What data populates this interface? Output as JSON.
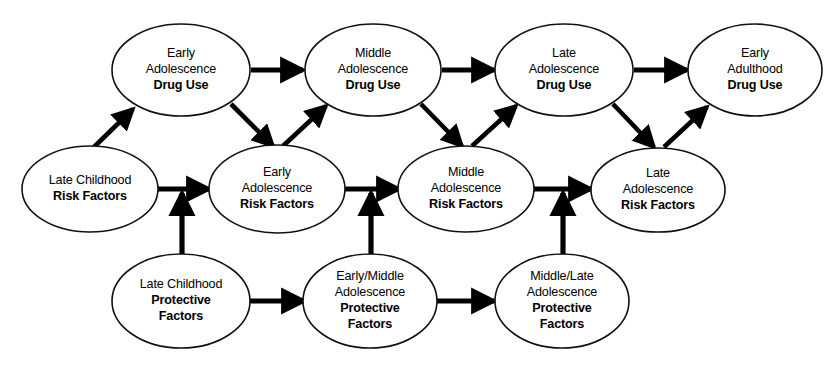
{
  "diagram": {
    "background_color": "#ffffff",
    "line_color": "#000000",
    "node_fill": "#ffffff",
    "node_stroke": "#111111",
    "rows": {
      "top_label": "Drug Use",
      "middle_label": "Risk Factors",
      "bottom_label": "Protective Factors"
    },
    "nodes": [
      {
        "id": "ea-drug-use",
        "name": "early-adolescence-drug-use",
        "cx": 181,
        "cy": 70,
        "rx": 69,
        "ry": 46,
        "lines": [
          {
            "text": "Early",
            "bold": false
          },
          {
            "text": "Adolescence",
            "bold": false
          },
          {
            "text": "Drug Use",
            "bold": true
          }
        ]
      },
      {
        "id": "ma-drug-use",
        "name": "middle-adolescence-drug-use",
        "cx": 373,
        "cy": 70,
        "rx": 68,
        "ry": 46,
        "lines": [
          {
            "text": "Middle",
            "bold": false
          },
          {
            "text": "Adolescence",
            "bold": false
          },
          {
            "text": "Drug Use",
            "bold": true
          }
        ]
      },
      {
        "id": "la-drug-use",
        "name": "late-adolescence-drug-use",
        "cx": 564,
        "cy": 70,
        "rx": 69,
        "ry": 46,
        "lines": [
          {
            "text": "Late",
            "bold": false
          },
          {
            "text": "Adolescence",
            "bold": false
          },
          {
            "text": "Drug Use",
            "bold": true
          }
        ]
      },
      {
        "id": "eadult-drug-use",
        "name": "early-adulthood-drug-use",
        "cx": 755,
        "cy": 70,
        "rx": 67,
        "ry": 46,
        "lines": [
          {
            "text": "Early",
            "bold": false
          },
          {
            "text": "Adulthood",
            "bold": false
          },
          {
            "text": "Drug Use",
            "bold": true
          }
        ]
      },
      {
        "id": "lc-risk",
        "name": "late-childhood-risk-factors",
        "cx": 90,
        "cy": 189,
        "rx": 68,
        "ry": 43,
        "lines": [
          {
            "text": "Late Childhood",
            "bold": false
          },
          {
            "text": "Risk Factors",
            "bold": true
          }
        ]
      },
      {
        "id": "ea-risk",
        "name": "early-adolescence-risk-factors",
        "cx": 277,
        "cy": 189,
        "rx": 68,
        "ry": 44,
        "lines": [
          {
            "text": "Early",
            "bold": false
          },
          {
            "text": "Adolescence",
            "bold": false
          },
          {
            "text": "Risk Factors",
            "bold": true
          }
        ]
      },
      {
        "id": "ma-risk",
        "name": "middle-adolescence-risk-factors",
        "cx": 466,
        "cy": 189,
        "rx": 68,
        "ry": 43,
        "lines": [
          {
            "text": "Middle",
            "bold": false
          },
          {
            "text": "Adolescence",
            "bold": false
          },
          {
            "text": "Risk Factors",
            "bold": true
          }
        ]
      },
      {
        "id": "la-risk",
        "name": "late-adolescence-risk-factors",
        "cx": 658,
        "cy": 190,
        "rx": 67,
        "ry": 42,
        "lines": [
          {
            "text": "Late",
            "bold": false
          },
          {
            "text": "Adolescence",
            "bold": false
          },
          {
            "text": "Risk Factors",
            "bold": true
          }
        ]
      },
      {
        "id": "lc-protective",
        "name": "late-childhood-protective-factors",
        "cx": 181,
        "cy": 301,
        "rx": 69,
        "ry": 47,
        "lines": [
          {
            "text": "Late Childhood",
            "bold": false
          },
          {
            "text": "Protective",
            "bold": true
          },
          {
            "text": "Factors",
            "bold": true
          }
        ]
      },
      {
        "id": "em-protective",
        "name": "early-middle-adolescence-protective-factors",
        "cx": 370,
        "cy": 301,
        "rx": 67,
        "ry": 47,
        "lines": [
          {
            "text": "Early/Middle",
            "bold": false
          },
          {
            "text": "Adolescence",
            "bold": false
          },
          {
            "text": "Protective",
            "bold": true
          },
          {
            "text": "Factors",
            "bold": true
          }
        ]
      },
      {
        "id": "ml-protective",
        "name": "middle-late-adolescence-protective-factors",
        "cx": 562,
        "cy": 301,
        "rx": 67,
        "ry": 47,
        "lines": [
          {
            "text": "Middle/Late",
            "bold": false
          },
          {
            "text": "Adolescence",
            "bold": false
          },
          {
            "text": "Protective",
            "bold": true
          },
          {
            "text": "Factors",
            "bold": true
          }
        ]
      }
    ],
    "edges": [
      {
        "id": "e1",
        "name": "arrow-early-to-middle-drug-use",
        "from": "ea-drug-use",
        "to": "ma-drug-use",
        "kind": "horizontal",
        "x1": 251,
        "y1": 70,
        "x2": 303,
        "y2": 70
      },
      {
        "id": "e2",
        "name": "arrow-middle-to-late-drug-use",
        "from": "ma-drug-use",
        "to": "la-drug-use",
        "kind": "horizontal",
        "x1": 442,
        "y1": 70,
        "x2": 494,
        "y2": 70
      },
      {
        "id": "e3",
        "name": "arrow-late-adolescence-to-early-adulthood-drug-use",
        "from": "la-drug-use",
        "to": "eadult-drug-use",
        "kind": "horizontal",
        "x1": 634,
        "y1": 70,
        "x2": 687,
        "y2": 70
      },
      {
        "id": "e4",
        "name": "arrow-late-childhood-risk-to-early-adolescence-drug-use",
        "from": "lc-risk",
        "to": "ea-drug-use",
        "kind": "diagonal-up",
        "x1": 94,
        "y1": 147,
        "x2": 133,
        "y2": 109
      },
      {
        "id": "e5",
        "name": "arrow-early-adolescence-drug-use-to-early-adolescence-risk",
        "from": "ea-drug-use",
        "to": "ea-risk",
        "kind": "diagonal-down",
        "x1": 231,
        "y1": 104,
        "x2": 273,
        "y2": 146
      },
      {
        "id": "e6",
        "name": "arrow-early-adolescence-risk-to-middle-adolescence-drug-use",
        "from": "ea-risk",
        "to": "ma-drug-use",
        "kind": "diagonal-up",
        "x1": 283,
        "y1": 146,
        "x2": 326,
        "y2": 106
      },
      {
        "id": "e7",
        "name": "arrow-middle-adolescence-drug-use-to-middle-adolescence-risk",
        "from": "ma-drug-use",
        "to": "ma-risk",
        "kind": "diagonal-down",
        "x1": 421,
        "y1": 104,
        "x2": 462,
        "y2": 146
      },
      {
        "id": "e8",
        "name": "arrow-middle-adolescence-risk-to-late-adolescence-drug-use",
        "from": "ma-risk",
        "to": "la-drug-use",
        "kind": "diagonal-up",
        "x1": 472,
        "y1": 146,
        "x2": 516,
        "y2": 106
      },
      {
        "id": "e9",
        "name": "arrow-late-adolescence-drug-use-to-late-adolescence-risk",
        "from": "la-drug-use",
        "to": "la-risk",
        "kind": "diagonal-down",
        "x1": 613,
        "y1": 104,
        "x2": 654,
        "y2": 147
      },
      {
        "id": "e10",
        "name": "arrow-late-adolescence-risk-to-early-adulthood-drug-use",
        "from": "la-risk",
        "to": "eadult-drug-use",
        "kind": "diagonal-up",
        "x1": 664,
        "y1": 147,
        "x2": 707,
        "y2": 107
      },
      {
        "id": "e11",
        "name": "arrow-late-childhood-risk-to-early-adolescence-risk",
        "from": "lc-risk",
        "to": "ea-risk",
        "kind": "horizontal",
        "x1": 157,
        "y1": 189,
        "x2": 209,
        "y2": 189
      },
      {
        "id": "e12",
        "name": "arrow-early-adolescence-risk-to-middle-adolescence-risk",
        "from": "ea-risk",
        "to": "ma-risk",
        "kind": "horizontal",
        "x1": 345,
        "y1": 189,
        "x2": 399,
        "y2": 189
      },
      {
        "id": "e13",
        "name": "arrow-middle-adolescence-risk-to-late-adolescence-risk",
        "from": "ma-risk",
        "to": "la-risk",
        "kind": "horizontal",
        "x1": 534,
        "y1": 189,
        "x2": 591,
        "y2": 189
      },
      {
        "id": "e14",
        "name": "arrow-late-childhood-protective-to-early-middle-protective",
        "from": "lc-protective",
        "to": "em-protective",
        "kind": "horizontal",
        "x1": 249,
        "y1": 301,
        "x2": 304,
        "y2": 301
      },
      {
        "id": "e15",
        "name": "arrow-early-middle-protective-to-middle-late-protective",
        "from": "em-protective",
        "to": "ml-protective",
        "kind": "horizontal",
        "x1": 437,
        "y1": 301,
        "x2": 494,
        "y2": 301
      },
      {
        "id": "e16",
        "name": "arrow-late-childhood-protective-to-risk-path",
        "from": "lc-protective",
        "to": "ea-risk",
        "kind": "vertical-up",
        "x1": 182,
        "y1": 257,
        "x2": 182,
        "y2": 193
      },
      {
        "id": "e17",
        "name": "arrow-early-middle-protective-to-risk-path",
        "from": "em-protective",
        "to": "ma-risk",
        "kind": "vertical-up",
        "x1": 371,
        "y1": 257,
        "x2": 371,
        "y2": 193
      },
      {
        "id": "e18",
        "name": "arrow-middle-late-protective-to-risk-path",
        "from": "ml-protective",
        "to": "la-risk",
        "kind": "vertical-up",
        "x1": 563,
        "y1": 257,
        "x2": 563,
        "y2": 193
      }
    ]
  }
}
